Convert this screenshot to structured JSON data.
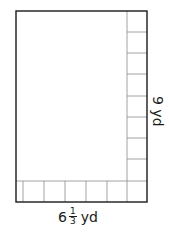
{
  "diagram": {
    "type": "rectangle-area-model",
    "width_label": {
      "whole": "6",
      "numerator": "1",
      "denominator": "3",
      "unit": "yd"
    },
    "height_label": {
      "text": "9 yd"
    },
    "colors": {
      "outline": "#1a1a1a",
      "grid": "#8a8a8a",
      "background": "#ffffff"
    },
    "bottom_row_cells": 7,
    "right_column_cells": 9
  }
}
